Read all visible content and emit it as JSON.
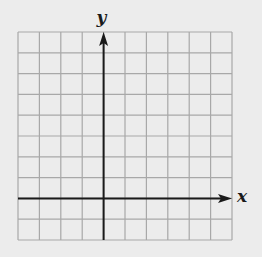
{
  "diagram": {
    "type": "coordinate-grid",
    "x_axis_label": "x",
    "y_axis_label": "y",
    "grid": {
      "columns": 10,
      "rows": 10,
      "left": 18,
      "top": 32,
      "right": 232,
      "bottom": 240,
      "y_axis_column_index": 4,
      "x_axis_row_index": 8
    },
    "colors": {
      "background": "#ececec",
      "grid_line": "#a8a8a8",
      "axis": "#1a1a1a"
    },
    "arrows": {
      "x_axis": "positive-end",
      "y_axis": "positive-end"
    }
  }
}
